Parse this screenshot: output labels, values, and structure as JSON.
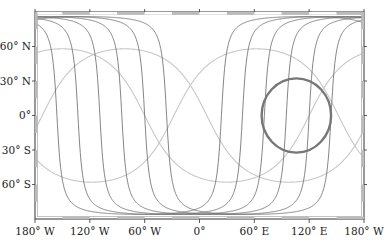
{
  "chart_data": {
    "type": "line",
    "title": "",
    "projection": "equirectangular",
    "xlabel": "",
    "ylabel": "",
    "xlim": [
      -180,
      180
    ],
    "ylim": [
      -90,
      90
    ],
    "x_ticks": [
      {
        "value": -180,
        "label": "180° W"
      },
      {
        "value": -120,
        "label": "120° W"
      },
      {
        "value": -60,
        "label": "60° W"
      },
      {
        "value": 0,
        "label": "0°"
      },
      {
        "value": 60,
        "label": "60° E"
      },
      {
        "value": 120,
        "label": "120° E"
      },
      {
        "value": 180,
        "label": "180° W"
      }
    ],
    "y_ticks": [
      {
        "value": 60,
        "label": "60° N"
      },
      {
        "value": 30,
        "label": "30° N"
      },
      {
        "value": 0,
        "label": "0°"
      },
      {
        "value": -30,
        "label": "30° S"
      },
      {
        "value": -60,
        "label": "60° S"
      }
    ],
    "series": [
      {
        "name": "high-inclination great circles",
        "color": "#666666",
        "inclination_deg": 86,
        "descending_node_lons": [
          -156,
          -133,
          -109,
          -85,
          -60,
          -36
        ]
      },
      {
        "name": "low-inclination great circles",
        "color": "#c8c8c8",
        "inclination_deg": 58,
        "peak_lons": [
          -150,
          -82,
          62
        ]
      }
    ],
    "circle": {
      "center_lon": 106,
      "center_lat": 0,
      "radius_deg_lon": 38,
      "color": "#777777"
    },
    "grid": false,
    "legend": null
  },
  "frame": {
    "left": 35,
    "right": 364,
    "top": 12,
    "bottom": 219
  }
}
